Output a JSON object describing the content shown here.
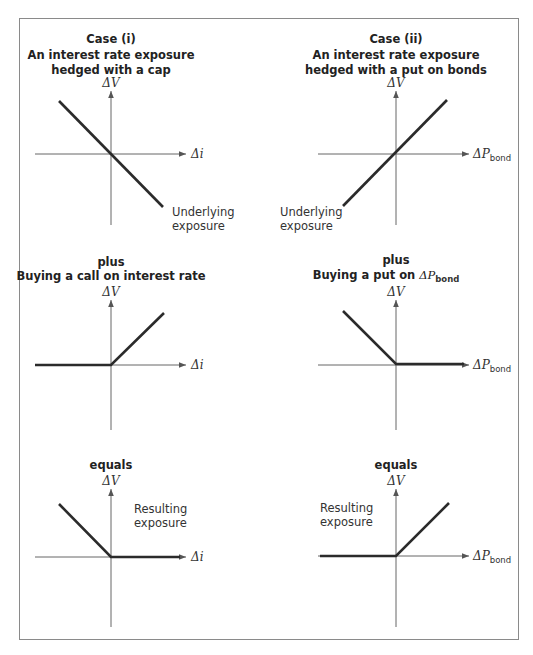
{
  "figure": {
    "left_column": {
      "case_title": "Case (i)",
      "case_subtitle_line1": "An interest rate exposure",
      "case_subtitle_line2": "hedged with a cap",
      "panel1": {
        "y_label": "ΔV",
        "x_label": "Δi",
        "annotation_line1": "Underlying",
        "annotation_line2": "exposure"
      },
      "panel2": {
        "heading": "plus",
        "subheading": "Buying a call on interest rate",
        "y_label": "ΔV",
        "x_label": "Δi"
      },
      "panel3": {
        "heading": "equals",
        "y_label": "ΔV",
        "x_label": "Δi",
        "annotation_line1": "Resulting",
        "annotation_line2": "exposure"
      }
    },
    "right_column": {
      "case_title": "Case (ii)",
      "case_subtitle_line1": "An interest rate exposure",
      "case_subtitle_line2": "hedged with a put on bonds",
      "panel1": {
        "y_label": "ΔV",
        "x_label_main": "ΔP",
        "x_label_sub": "bond",
        "annotation_line1": "Underlying",
        "annotation_line2": "exposure"
      },
      "panel2": {
        "heading": "plus",
        "subheading_prefix": "Buying a put on ",
        "subheading_var": "ΔP",
        "subheading_sub": "bond",
        "y_label": "ΔV",
        "x_label_main": "ΔP",
        "x_label_sub": "bond"
      },
      "panel3": {
        "heading": "equals",
        "y_label": "ΔV",
        "x_label_main": "ΔP",
        "x_label_sub": "bond",
        "annotation_line1": "Resulting",
        "annotation_line2": "exposure"
      }
    }
  },
  "colors": {
    "payoff_line": "#2b2b2b",
    "axis": "#666666",
    "frame": "#8a8a8a"
  }
}
